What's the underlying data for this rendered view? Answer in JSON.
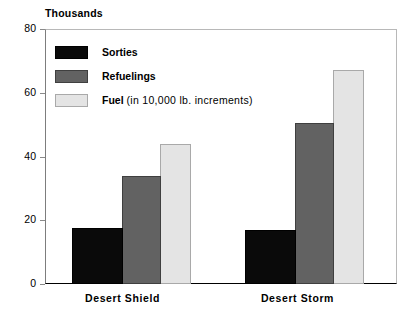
{
  "chart_data": {
    "type": "bar",
    "title": "",
    "subtitle": "",
    "unit_caption": "Thousands",
    "categories": [
      "Desert Shield",
      "Desert Storm"
    ],
    "series": [
      {
        "name": "Sorties",
        "note": "",
        "values": [
          17.5,
          16.8
        ],
        "color": "#0a0a0a"
      },
      {
        "name": "Refuelings",
        "note": "",
        "values": [
          34,
          50.5
        ],
        "color": "#626262"
      },
      {
        "name": "Fuel",
        "note": "(in 10,000 lb. increments)",
        "values": [
          44,
          67
        ],
        "color": "#e4e4e4"
      }
    ],
    "xlabel": "",
    "ylabel": "Thousands",
    "ylim": [
      0,
      80
    ],
    "yticks": [
      0,
      20,
      40,
      60,
      80
    ],
    "ytick_labels": [
      "0",
      "20",
      "40",
      "60",
      "80"
    ],
    "grid": false,
    "legend_position": "inside-top-left"
  },
  "legend": {
    "items": [
      {
        "label": "Sorties",
        "note": ""
      },
      {
        "label": "Refuelings",
        "note": ""
      },
      {
        "label": "Fuel",
        "note": "(in 10,000 lb. increments)"
      }
    ]
  },
  "axis": {
    "unit_caption": "Thousands",
    "y_tick_0": "0",
    "y_tick_1": "20",
    "y_tick_2": "40",
    "y_tick_3": "60",
    "y_tick_4": "80",
    "x_label_0": "Desert Shield",
    "x_label_1": "Desert Storm"
  },
  "colors": {
    "sorties": "#0a0a0a",
    "refuelings": "#626262",
    "fuel": "#e4e4e4",
    "axis": "#000000",
    "frame": "#b8b8b8"
  }
}
